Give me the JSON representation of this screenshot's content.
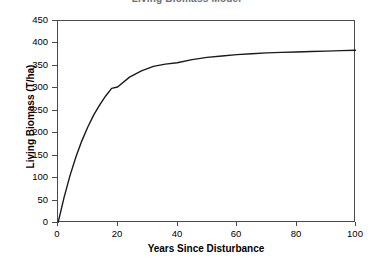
{
  "chart_data": {
    "type": "line",
    "title": "Living Biomass Model",
    "xlabel": "Years Since Disturbance",
    "ylabel": "Living Biomass (T/ha)",
    "xlim": [
      0,
      100
    ],
    "ylim": [
      0,
      450
    ],
    "xticks": [
      0,
      20,
      40,
      60,
      80,
      100
    ],
    "yticks": [
      0,
      50,
      100,
      150,
      200,
      250,
      300,
      350,
      400,
      450
    ],
    "xtick_labels": [
      "0",
      "20",
      "40",
      "60",
      "80",
      "100"
    ],
    "ytick_labels": [
      "0",
      "50",
      "100",
      "150",
      "200",
      "250",
      "300",
      "350",
      "400",
      "450"
    ],
    "grid": false,
    "legend": false,
    "line_color": "#1a1a1a",
    "frame_color": "#4a4a4a",
    "background": "#ffffff",
    "series": [
      {
        "name": "Living Biomass",
        "x": [
          0,
          2,
          4,
          6,
          8,
          10,
          12,
          14,
          16,
          18,
          20,
          24,
          28,
          32,
          36,
          40,
          45,
          50,
          55,
          60,
          65,
          70,
          75,
          80,
          85,
          90,
          95,
          100
        ],
        "values": [
          0,
          56,
          105,
          147,
          183,
          214,
          241,
          263,
          283,
          300,
          303,
          325,
          339,
          349,
          354,
          357,
          364,
          369,
          372,
          375,
          377,
          379,
          380,
          381,
          382,
          383,
          384,
          385
        ]
      }
    ],
    "asymptote": 385
  }
}
